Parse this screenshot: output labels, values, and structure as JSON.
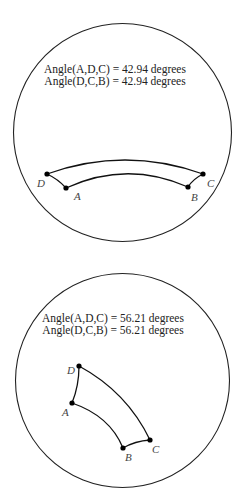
{
  "panels": [
    {
      "id": "top",
      "disk": {
        "cx": 122.5,
        "cy": 132.5,
        "r": 109
      },
      "captions": [
        {
          "text": "Angle(A,D,C) = 42.94 degrees",
          "x": 115,
          "y": 73
        },
        {
          "text": "Angle(D,C,B) = 42.94 degrees",
          "x": 115,
          "y": 85
        }
      ],
      "vertices": {
        "D": {
          "x": 47,
          "y": 174,
          "label_x": 37,
          "label_y": 187
        },
        "A": {
          "x": 66,
          "y": 188,
          "label_x": 74,
          "label_y": 200
        },
        "B": {
          "x": 188,
          "y": 187,
          "label_x": 191,
          "label_y": 201
        },
        "C": {
          "x": 203,
          "y": 174,
          "label_x": 207,
          "label_y": 187
        }
      },
      "edges": {
        "DC": "M47,174 Q125,146 203,174",
        "AB": "M66,188 Q127,160 188,187",
        "DA": "M47,174 Q58,179 66,188",
        "CB": "M203,174 Q193,179 188,187"
      }
    },
    {
      "id": "bottom",
      "disk": {
        "cx": 122.5,
        "cy": 380.5,
        "r": 107
      },
      "captions": [
        {
          "text": "Angle(A,D,C) = 56.21 degrees",
          "x": 113,
          "y": 322
        },
        {
          "text": "Angle(D,C,B) = 56.21 degrees",
          "x": 113,
          "y": 334
        }
      ],
      "vertices": {
        "D": {
          "x": 79,
          "y": 366,
          "label_x": 67,
          "label_y": 374
        },
        "A": {
          "x": 72,
          "y": 403,
          "label_x": 62,
          "label_y": 416
        },
        "B": {
          "x": 123,
          "y": 448,
          "label_x": 125,
          "label_y": 461
        },
        "C": {
          "x": 150,
          "y": 440,
          "label_x": 152,
          "label_y": 453
        }
      },
      "edges": {
        "DC": "M79,366 Q127,392 150,440",
        "AB": "M72,403 Q110,416 123,448",
        "DA": "M79,366 Q79,386 72,403",
        "BC": "M123,448 Q135,441 150,440"
      }
    }
  ]
}
